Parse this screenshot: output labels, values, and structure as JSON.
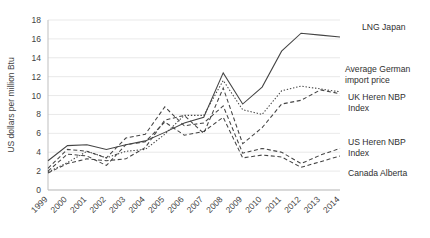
{
  "chart_data": {
    "type": "line",
    "title": "",
    "xlabel": "",
    "ylabel": "US dollars per million Btu",
    "ylim": [
      0,
      18
    ],
    "ytick_step": 2,
    "grid": true,
    "legend_position": "right-inline",
    "categories": [
      "1999",
      "2000",
      "2001",
      "2002",
      "2003",
      "2004",
      "2005",
      "2006",
      "2007",
      "2008",
      "2009",
      "2010",
      "2011",
      "2012",
      "2013",
      "2014"
    ],
    "series": [
      {
        "name": "LNG Japan",
        "style": "solid",
        "color": "#444444",
        "values": [
          3.1,
          4.7,
          4.8,
          4.3,
          4.8,
          5.2,
          6.1,
          7.1,
          7.7,
          12.4,
          9.1,
          10.9,
          14.7,
          16.6,
          16.4,
          16.2
        ]
      },
      {
        "name": "Average German import price",
        "style": "dotted",
        "color": "#444444",
        "values": [
          1.9,
          2.9,
          4.1,
          3.4,
          4.1,
          4.3,
          5.9,
          7.9,
          7.9,
          11.6,
          8.5,
          8.0,
          10.5,
          11.0,
          10.7,
          10.4
        ]
      },
      {
        "name": "UK Heren NBP Index",
        "style": "dashed",
        "color": "#444444",
        "values": [
          1.8,
          2.8,
          3.3,
          3.1,
          3.3,
          4.5,
          7.4,
          7.9,
          6.0,
          10.8,
          4.9,
          6.6,
          9.1,
          9.5,
          10.6,
          10.2
        ]
      },
      {
        "name": "US Heren NBP Index",
        "style": "dashed",
        "color": "#444444",
        "values": [
          2.3,
          4.3,
          4.1,
          3.4,
          5.5,
          5.9,
          8.8,
          6.8,
          7.1,
          8.9,
          3.9,
          4.4,
          4.0,
          2.8,
          3.7,
          4.4
        ]
      },
      {
        "name": "Canada Alberta",
        "style": "dashed",
        "color": "#444444",
        "values": [
          2.0,
          3.8,
          3.6,
          2.6,
          4.8,
          5.1,
          7.2,
          5.8,
          6.2,
          7.7,
          3.4,
          3.7,
          3.5,
          2.4,
          3.0,
          3.6
        ]
      }
    ],
    "inline_labels": [
      {
        "name": "LNG Japan",
        "lines": [
          "LNG Japan"
        ]
      },
      {
        "name": "Average German import price",
        "lines": [
          "Average German",
          "import price"
        ]
      },
      {
        "name": "UK Heren NBP Index",
        "lines": [
          "UK Heren NBP",
          "Index"
        ]
      },
      {
        "name": "US Heren NBP Index",
        "lines": [
          "US Heren NBP",
          "Index"
        ]
      },
      {
        "name": "Canada Alberta",
        "lines": [
          "Canada Alberta"
        ]
      }
    ],
    "ytick_labels": [
      "0",
      "2",
      "4",
      "6",
      "8",
      "10",
      "12",
      "14",
      "16",
      "18"
    ]
  }
}
